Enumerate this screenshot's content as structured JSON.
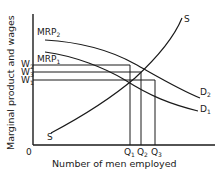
{
  "diagram": {
    "y_axis_label": "Marginal product and wages",
    "x_axis_label": "Number of men employed",
    "origin": "0",
    "curves": {
      "mrp2": {
        "label": "MRP",
        "sub": "2"
      },
      "mrp1": {
        "label": "MRP",
        "sub": "1"
      },
      "d2": {
        "label": "D",
        "sub": "2"
      },
      "d1": {
        "label": "D",
        "sub": "1"
      },
      "supply_top": {
        "label": "S"
      },
      "supply_bottom": {
        "label": "S"
      }
    },
    "wage_levels": [
      {
        "label": "W",
        "sub": "2"
      },
      {
        "label": "W",
        "sub": "3"
      },
      {
        "label": "W",
        "sub": "1"
      }
    ],
    "quantities": [
      {
        "label": "Q",
        "sub": "1"
      },
      {
        "label": "Q",
        "sub": "2"
      },
      {
        "label": "Q",
        "sub": "3"
      }
    ]
  }
}
